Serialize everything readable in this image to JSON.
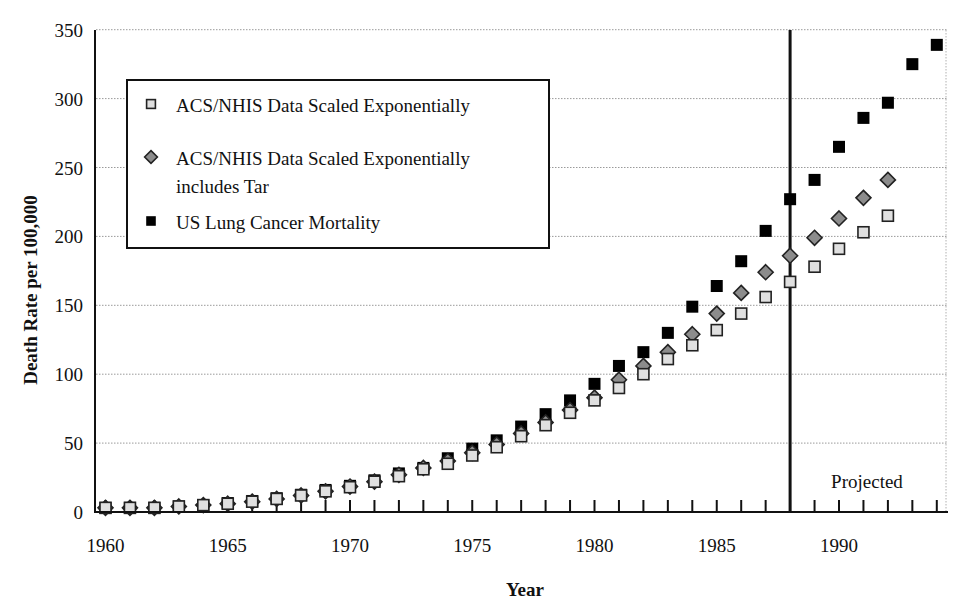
{
  "chart_data": {
    "type": "scatter",
    "title": "",
    "xlabel": "Year",
    "ylabel": "Death Rate per 100,000",
    "xlim": [
      1960,
      1994
    ],
    "ylim": [
      0,
      350
    ],
    "x_ticks": [
      1960,
      1965,
      1970,
      1975,
      1980,
      1985,
      1990
    ],
    "y_ticks": [
      0,
      50,
      100,
      150,
      200,
      250,
      300,
      350
    ],
    "grid": "horizontal dotted",
    "legend_position": "upper-left",
    "annotations": [
      {
        "type": "vertical-line",
        "x": 1988
      },
      {
        "type": "text",
        "text": "Projected",
        "x": 1991,
        "y": 25
      }
    ],
    "series": [
      {
        "name": "ACS/NHIS Data Scaled Exponentially",
        "marker": "square",
        "color": "#e0e0e0",
        "x": [
          1960,
          1961,
          1962,
          1963,
          1964,
          1965,
          1966,
          1967,
          1968,
          1969,
          1970,
          1971,
          1972,
          1973,
          1974,
          1975,
          1976,
          1977,
          1978,
          1979,
          1980,
          1981,
          1982,
          1983,
          1984,
          1985,
          1986,
          1987,
          1988,
          1989,
          1990,
          1991,
          1992
        ],
        "values": [
          3,
          3,
          3,
          4,
          5,
          6,
          7.5,
          9.5,
          12,
          15,
          18,
          22,
          26,
          31,
          35,
          41,
          47,
          55,
          63,
          72,
          81,
          90,
          100,
          111,
          121,
          132,
          144,
          156,
          167,
          178,
          191,
          203,
          215
        ]
      },
      {
        "name": "ACS/NHIS Data Scaled Exponentially includes Tar",
        "marker": "diamond",
        "color": "#8c8c8c",
        "x": [
          1960,
          1961,
          1962,
          1963,
          1964,
          1965,
          1966,
          1967,
          1968,
          1969,
          1970,
          1971,
          1972,
          1973,
          1974,
          1975,
          1976,
          1977,
          1978,
          1979,
          1980,
          1981,
          1982,
          1983,
          1984,
          1985,
          1986,
          1987,
          1988,
          1989,
          1990,
          1991,
          1992
        ],
        "values": [
          3,
          3,
          3,
          4,
          5,
          6,
          7.5,
          9.5,
          12,
          15,
          18.5,
          22,
          27,
          32,
          37,
          43,
          49,
          57,
          65,
          74,
          83,
          96,
          106,
          116,
          129,
          144,
          159,
          174,
          186,
          199,
          213,
          228,
          241
        ]
      },
      {
        "name": "US Lung Cancer Mortality",
        "marker": "square",
        "color": "#000000",
        "x": [
          1960,
          1961,
          1962,
          1963,
          1964,
          1965,
          1966,
          1967,
          1968,
          1969,
          1970,
          1971,
          1972,
          1973,
          1974,
          1975,
          1976,
          1977,
          1978,
          1979,
          1980,
          1981,
          1982,
          1983,
          1984,
          1985,
          1986,
          1987,
          1988,
          1989,
          1990,
          1991,
          1992,
          1993,
          1994
        ],
        "values": [
          3,
          3,
          3,
          4,
          5,
          6.5,
          8,
          10,
          12.5,
          16,
          19,
          23,
          28,
          32,
          39,
          46,
          52,
          62,
          71,
          81,
          93,
          106,
          116,
          130,
          149,
          164,
          182,
          204,
          227,
          241,
          265,
          286,
          297,
          325,
          339
        ]
      }
    ]
  },
  "legend": {
    "items": [
      {
        "label_lines": [
          "ACS/NHIS Data Scaled Exponentially"
        ]
      },
      {
        "label_lines": [
          "ACS/NHIS Data Scaled Exponentially",
          "includes Tar"
        ]
      },
      {
        "label_lines": [
          "US Lung Cancer Mortality"
        ]
      }
    ]
  },
  "axes": {
    "x_title": "Year",
    "y_title": "Death Rate per 100,000"
  },
  "annotation_text": "Projected"
}
